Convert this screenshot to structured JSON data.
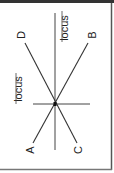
{
  "diagram": {
    "points": {
      "A": "A",
      "B": "B",
      "C": "C",
      "D": "D"
    },
    "locus_labels": [
      "locus",
      "locus"
    ],
    "colors": {
      "line": "#333333",
      "border": "#555555",
      "background": "#ffffff"
    }
  }
}
